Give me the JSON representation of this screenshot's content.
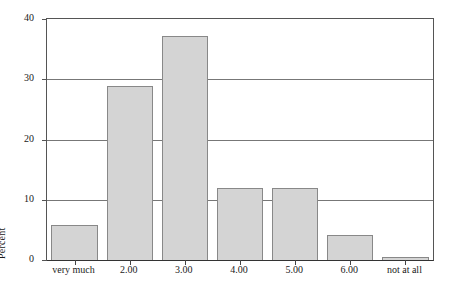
{
  "chart_data": {
    "type": "bar",
    "title": "",
    "subtitle": "",
    "xlabel": "",
    "ylabel": "Percent",
    "categories": [
      "very much",
      "2.00",
      "3.00",
      "4.00",
      "5.00",
      "6.00",
      "not at all"
    ],
    "values": [
      5.8,
      28.8,
      37.2,
      12.0,
      12.0,
      4.2,
      0.5
    ],
    "series": [
      {
        "name": "Percent",
        "values": [
          5.8,
          28.8,
          37.2,
          12.0,
          12.0,
          4.2,
          0.5
        ]
      }
    ],
    "ylim": [
      0,
      40
    ],
    "yticks": [
      0,
      10,
      20,
      30,
      40
    ],
    "ytick_labels": [
      "0",
      "10",
      "20",
      "30",
      "40"
    ],
    "xlim_categories": 7,
    "grid": true,
    "grid_axis": "y",
    "legend": false,
    "legend_position": "none",
    "bar_fill_color": "#d4d4d4",
    "bar_border_color": "#888888",
    "gridline_color": "#777777",
    "axis_color": "#555555",
    "background_color": "#ffffff",
    "annotations": []
  }
}
